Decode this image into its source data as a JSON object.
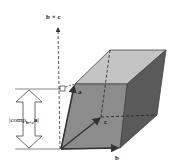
{
  "diagram": {
    "labels": {
      "cross": "b × c",
      "a": "a",
      "b": "b",
      "c": "c",
      "comp_prefix": "|comp",
      "comp_sub": "b×c",
      "comp_suffix": "a|"
    },
    "colors": {
      "front_face": "#8c8c8c",
      "top_face": "#c4c4c4",
      "side_face": "#5a5a5a",
      "edge": "#3a3a3a",
      "vector": "#333333",
      "background": "#ffffff"
    }
  }
}
